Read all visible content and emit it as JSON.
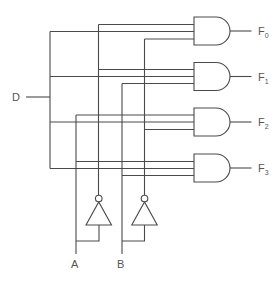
{
  "diagram": {
    "type": "2-to-4 line demultiplexer (decoder with data input)",
    "inputs": {
      "data": "D",
      "select_a": "A",
      "select_b": "B"
    },
    "outputs": [
      {
        "name": "F",
        "sub": "0",
        "inputs": [
          "A'",
          "D",
          "B'"
        ]
      },
      {
        "name": "F",
        "sub": "1",
        "inputs": [
          "A'",
          "D",
          "B"
        ]
      },
      {
        "name": "F",
        "sub": "2",
        "inputs": [
          "A",
          "D",
          "B'"
        ]
      },
      {
        "name": "F",
        "sub": "3",
        "inputs": [
          "A",
          "D",
          "B"
        ]
      }
    ],
    "components": {
      "and_gates": 4,
      "inverters": 2
    },
    "colors": {
      "line": "#4a4a4a",
      "text": "#555555",
      "background": "#ffffff"
    }
  }
}
